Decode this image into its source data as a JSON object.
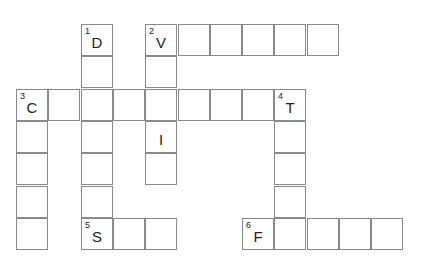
{
  "puzzle": {
    "type": "crossword",
    "cell_size": 32,
    "origin": {
      "x": 16,
      "y": 24
    },
    "cells": [
      {
        "r": 0,
        "c": 2,
        "num": "1",
        "letter": "D"
      },
      {
        "r": 1,
        "c": 2
      },
      {
        "r": 2,
        "c": 2
      },
      {
        "r": 3,
        "c": 2
      },
      {
        "r": 4,
        "c": 2
      },
      {
        "r": 5,
        "c": 2
      },
      {
        "r": 6,
        "c": 2,
        "num": "5",
        "letter": "S"
      },
      {
        "r": 0,
        "c": 4,
        "num": "2",
        "letter": "V"
      },
      {
        "r": 0,
        "c": 5
      },
      {
        "r": 0,
        "c": 6
      },
      {
        "r": 0,
        "c": 7
      },
      {
        "r": 0,
        "c": 8
      },
      {
        "r": 0,
        "c": 9
      },
      {
        "r": 1,
        "c": 4
      },
      {
        "r": 2,
        "c": 4
      },
      {
        "r": 3,
        "c": 4,
        "letter": "I"
      },
      {
        "r": 4,
        "c": 4
      },
      {
        "r": 2,
        "c": 0,
        "num": "3",
        "letter": "C"
      },
      {
        "r": 2,
        "c": 1
      },
      {
        "r": 2,
        "c": 3
      },
      {
        "r": 2,
        "c": 5
      },
      {
        "r": 2,
        "c": 6
      },
      {
        "r": 2,
        "c": 7
      },
      {
        "r": 2,
        "c": 8,
        "num": "4",
        "letter": "T"
      },
      {
        "r": 3,
        "c": 0
      },
      {
        "r": 4,
        "c": 0
      },
      {
        "r": 5,
        "c": 0
      },
      {
        "r": 6,
        "c": 0
      },
      {
        "r": 3,
        "c": 8
      },
      {
        "r": 4,
        "c": 8
      },
      {
        "r": 5,
        "c": 8
      },
      {
        "r": 6,
        "c": 3
      },
      {
        "r": 6,
        "c": 4
      },
      {
        "r": 6,
        "c": 7,
        "num": "6",
        "letter": "F"
      },
      {
        "r": 6,
        "c": 8
      },
      {
        "r": 6,
        "c": 9
      },
      {
        "r": 6,
        "c": 10
      },
      {
        "r": 6,
        "c": 11
      }
    ],
    "clues": {
      "across": [
        {
          "num": "2",
          "start": "V",
          "length": 6
        },
        {
          "num": "3",
          "start": "C",
          "length": 9
        },
        {
          "num": "5",
          "start": "S",
          "length": 3
        },
        {
          "num": "6",
          "start": "F",
          "length": 5
        }
      ],
      "down": [
        {
          "num": "1",
          "start": "D",
          "length": 7
        },
        {
          "num": "2",
          "start": "V",
          "length": 5
        },
        {
          "num": "3",
          "start": "C",
          "length": 5
        },
        {
          "num": "4",
          "start": "T",
          "length": 5
        }
      ]
    }
  }
}
